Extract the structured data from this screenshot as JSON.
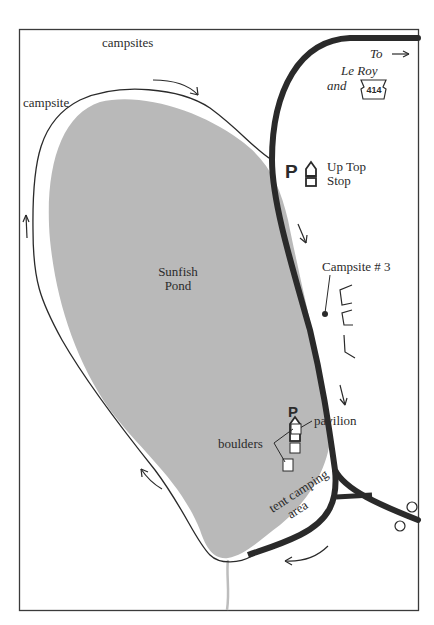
{
  "map": {
    "title": "Sunfish Pond",
    "colors": {
      "pond": "#b9b9b9",
      "road": "#2a2a2a",
      "trail": "#2a2a2a",
      "stream": "#bdbdbd",
      "frame": "#3a3a3a",
      "background": "#ffffff"
    },
    "labels": {
      "campsites": "campsites",
      "campsite": "campsite",
      "pond_line1": "Sunfish",
      "pond_line2": "Pond",
      "to": "To",
      "destination": "Le Roy",
      "and": "and",
      "route_number": "414",
      "parking_p1": "P",
      "up_top_line1": "Up Top",
      "up_top_line2": "Stop",
      "campsite3": "Campsite # 3",
      "parking_p2": "P",
      "pavilion": "pavilion",
      "boulders": "boulders",
      "tent_line1": "tent camping",
      "tent_line2": "area"
    },
    "icons": [
      {
        "name": "parking-icon",
        "label": "P",
        "location": "Up Top Stop"
      },
      {
        "name": "restroom-icon",
        "location": "Up Top Stop"
      },
      {
        "name": "parking-icon",
        "label": "P",
        "location": "pavilion"
      },
      {
        "name": "restroom-icon",
        "location": "pavilion"
      },
      {
        "name": "route-shield-icon",
        "label": "414"
      },
      {
        "name": "direction-arrow-icon",
        "count": 6
      }
    ]
  }
}
